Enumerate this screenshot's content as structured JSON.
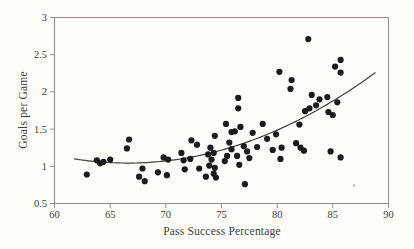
{
  "figure": {
    "background": "#fdfdfa",
    "frame_color": "#94928b",
    "tick_color": "#94928b",
    "text_color": "#3e3d39",
    "point_color": "#1b1b1b",
    "curve_color": "#40403c"
  },
  "chart_data": {
    "type": "scatter",
    "title": "",
    "xlabel": "Pass Success Percentage",
    "ylabel": "Goals per Game",
    "xlim": [
      60,
      90
    ],
    "ylim": [
      0.5,
      3
    ],
    "x_ticks": [
      60,
      65,
      70,
      75,
      80,
      85,
      90
    ],
    "x_tick_labels": [
      "60",
      "65",
      "70",
      "75",
      "80",
      "85",
      "90"
    ],
    "y_ticks": [
      0.5,
      1,
      1.5,
      2,
      2.5,
      3
    ],
    "y_tick_labels": [
      "0.5",
      "1",
      "1.5",
      "2",
      "2.5",
      "3"
    ],
    "grid": false,
    "legend": false,
    "points": [
      [
        62.9,
        0.89
      ],
      [
        63.8,
        1.08
      ],
      [
        64.1,
        1.04
      ],
      [
        64.4,
        1.06
      ],
      [
        65.0,
        1.09
      ],
      [
        66.5,
        1.24
      ],
      [
        66.7,
        1.36
      ],
      [
        67.6,
        0.86
      ],
      [
        67.9,
        0.97
      ],
      [
        68.1,
        0.8
      ],
      [
        69.3,
        0.92
      ],
      [
        69.8,
        1.12
      ],
      [
        70.1,
        0.88
      ],
      [
        70.2,
        1.09
      ],
      [
        71.4,
        1.18
      ],
      [
        71.6,
        1.08
      ],
      [
        71.7,
        0.96
      ],
      [
        72.2,
        1.1
      ],
      [
        72.3,
        1.35
      ],
      [
        72.8,
        1.29
      ],
      [
        73.0,
        0.97
      ],
      [
        73.6,
        0.86
      ],
      [
        73.8,
        1.16
      ],
      [
        73.9,
        1.01
      ],
      [
        74.0,
        1.25
      ],
      [
        74.1,
        1.09
      ],
      [
        74.3,
        1.18
      ],
      [
        74.3,
        0.9
      ],
      [
        74.4,
        0.98
      ],
      [
        74.5,
        0.85
      ],
      [
        74.4,
        1.41
      ],
      [
        75.3,
        1.07
      ],
      [
        75.4,
        1.57
      ],
      [
        75.5,
        1.14
      ],
      [
        75.7,
        1.32
      ],
      [
        75.9,
        1.23
      ],
      [
        75.9,
        1.46
      ],
      [
        76.2,
        1.47
      ],
      [
        76.4,
        1.14
      ],
      [
        76.5,
        1.92
      ],
      [
        76.5,
        1.78
      ],
      [
        76.6,
        1.02
      ],
      [
        76.7,
        1.53
      ],
      [
        77.0,
        1.27
      ],
      [
        77.1,
        0.76
      ],
      [
        77.3,
        1.2
      ],
      [
        77.5,
        1.11
      ],
      [
        77.8,
        1.45
      ],
      [
        78.2,
        1.26
      ],
      [
        78.7,
        1.57
      ],
      [
        79.1,
        1.37
      ],
      [
        79.6,
        1.22
      ],
      [
        79.9,
        1.43
      ],
      [
        80.2,
        2.27
      ],
      [
        80.3,
        1.1
      ],
      [
        80.4,
        1.25
      ],
      [
        81.2,
        2.04
      ],
      [
        81.3,
        2.16
      ],
      [
        81.7,
        1.31
      ],
      [
        82.0,
        1.56
      ],
      [
        82.1,
        1.25
      ],
      [
        82.4,
        1.21
      ],
      [
        82.5,
        1.74
      ],
      [
        82.8,
        2.71
      ],
      [
        82.9,
        1.78
      ],
      [
        83.1,
        1.96
      ],
      [
        83.5,
        1.82
      ],
      [
        83.8,
        1.9
      ],
      [
        84.5,
        1.93
      ],
      [
        84.6,
        1.73
      ],
      [
        85.0,
        1.69
      ],
      [
        84.8,
        1.2
      ],
      [
        85.2,
        2.34
      ],
      [
        85.4,
        1.86
      ],
      [
        85.7,
        2.43
      ],
      [
        85.7,
        2.26
      ],
      [
        85.7,
        1.12
      ]
    ],
    "point_radius": 3.1,
    "trendline": {
      "type": "quadratic",
      "a": 0.00246,
      "b": -0.3276,
      "c": 11.95,
      "x_start": 61.8,
      "x_end": 89.0
    },
    "artifact_speck": {
      "x": 86.9,
      "y": 0.74,
      "color": "#c3bfb6",
      "radius": 1.3
    }
  }
}
